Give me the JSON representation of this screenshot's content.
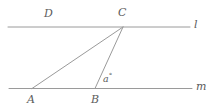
{
  "figure": {
    "type": "geometry-diagram",
    "width": 218,
    "height": 109,
    "background_color": "#ffffff",
    "stroke_color": "#9a9a9a",
    "text_color": "#5c5c5c",
    "stroke_width": 1,
    "lines": [
      {
        "name": "line-l",
        "label": "l",
        "x1": 8,
        "y1": 27,
        "x2": 190,
        "y2": 27
      },
      {
        "name": "line-m",
        "label": "m",
        "x1": 9,
        "y1": 88.5,
        "x2": 192,
        "y2": 88.5
      }
    ],
    "segments": [
      {
        "name": "segment-CA",
        "x1": 123,
        "y1": 27,
        "x2": 32,
        "y2": 88.5
      },
      {
        "name": "segment-CB",
        "x1": 123,
        "y1": 27,
        "x2": 95,
        "y2": 88.5
      }
    ],
    "points": [
      {
        "name": "point-D",
        "label": "D",
        "x": 48,
        "y": 27,
        "on": "line-l"
      },
      {
        "name": "point-C",
        "label": "C",
        "x": 123,
        "y": 27,
        "on": "line-l"
      },
      {
        "name": "point-A",
        "label": "A",
        "x": 32,
        "y": 88.5,
        "on": "line-m"
      },
      {
        "name": "point-B",
        "label": "B",
        "x": 95,
        "y": 88.5,
        "on": "line-m"
      }
    ],
    "angle": {
      "name": "angle-at-B",
      "variable": "a",
      "degree_symbol": "°",
      "label": "a°",
      "vertex": "B"
    },
    "labels": {
      "D": "D",
      "C": "C",
      "A": "A",
      "B": "B",
      "l": "l",
      "m": "m",
      "angle_variable": "a",
      "degree": "°"
    }
  }
}
